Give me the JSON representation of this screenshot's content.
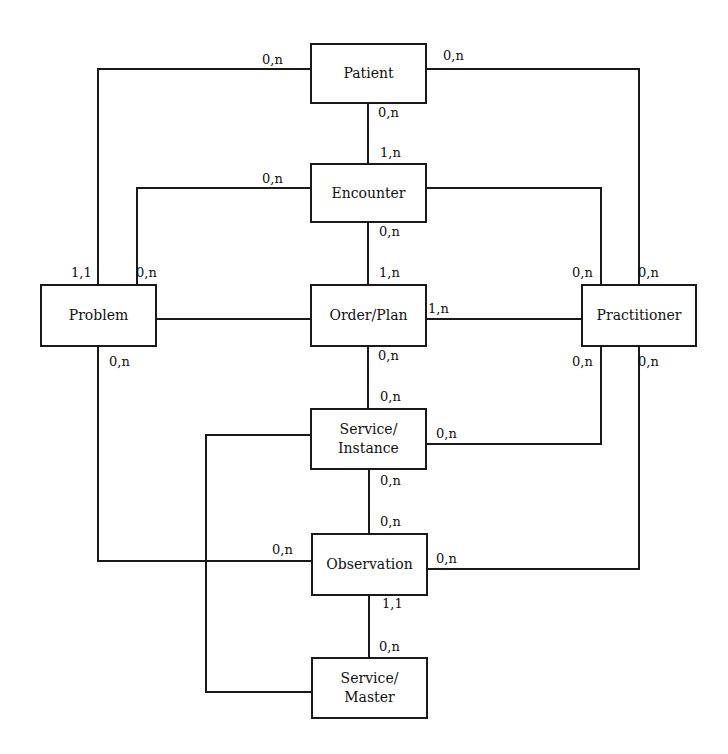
{
  "diagram": {
    "type": "entity-relationship",
    "colors": {
      "line": "#1a1a1a",
      "background": "#ffffff",
      "text": "#111111"
    },
    "entities": [
      {
        "id": "patient",
        "label": "Patient"
      },
      {
        "id": "encounter",
        "label": "Encounter"
      },
      {
        "id": "problem",
        "label": "Problem"
      },
      {
        "id": "order_plan",
        "label": "Order/Plan"
      },
      {
        "id": "practitioner",
        "label": "Practitioner"
      },
      {
        "id": "service_instance",
        "label": "Service/\nInstance"
      },
      {
        "id": "observation",
        "label": "Observation"
      },
      {
        "id": "service_master",
        "label": "Service/\nMaster"
      }
    ],
    "relationships": [
      {
        "from": "patient",
        "to": "encounter",
        "from_card": "0,n",
        "to_card": "1,n"
      },
      {
        "from": "patient",
        "to": "problem",
        "from_card": "0,n",
        "to_card": "1,1"
      },
      {
        "from": "patient",
        "to": "practitioner",
        "from_card": "0,n",
        "to_card": "0,n"
      },
      {
        "from": "encounter",
        "to": "problem",
        "from_card": "0,n",
        "to_card": "0,n"
      },
      {
        "from": "encounter",
        "to": "order_plan",
        "from_card": "0,n",
        "to_card": "1,n"
      },
      {
        "from": "encounter",
        "to": "practitioner",
        "from_card": "",
        "to_card": "0,n"
      },
      {
        "from": "problem",
        "to": "order_plan",
        "from_card": "",
        "to_card": ""
      },
      {
        "from": "order_plan",
        "to": "practitioner",
        "from_card": "1,n",
        "to_card": ""
      },
      {
        "from": "order_plan",
        "to": "service_instance",
        "from_card": "0,n",
        "to_card": "0,n"
      },
      {
        "from": "service_instance",
        "to": "practitioner",
        "from_card": "0,n",
        "to_card": "0,n"
      },
      {
        "from": "service_instance",
        "to": "observation",
        "from_card": "0,n",
        "to_card": "0,n"
      },
      {
        "from": "service_instance",
        "to": "service_master",
        "from_card": "",
        "to_card": ""
      },
      {
        "from": "problem",
        "to": "observation",
        "from_card": "0,n",
        "to_card": "0,n"
      },
      {
        "from": "observation",
        "to": "practitioner",
        "from_card": "0,n",
        "to_card": "0,n"
      },
      {
        "from": "observation",
        "to": "service_master",
        "from_card": "1,1",
        "to_card": "0,n"
      }
    ],
    "cardinality_labels": {
      "patient_left": "0,n",
      "patient_right": "0,n",
      "patient_bottom": "0,n",
      "encounter_top": "1,n",
      "encounter_left": "0,n",
      "encounter_bottom": "0,n",
      "problem_top_left": "1,1",
      "problem_top_right": "0,n",
      "problem_bottom": "0,n",
      "order_top": "1,n",
      "order_right": "1,n",
      "order_bottom": "0,n",
      "practitioner_top_left": "0,n",
      "practitioner_top_right": "0,n",
      "practitioner_bottom_left": "0,n",
      "practitioner_bottom_right": "0,n",
      "service_instance_top": "0,n",
      "service_instance_right": "0,n",
      "service_instance_bottom": "0,n",
      "observation_top": "0,n",
      "observation_left": "0,n",
      "observation_right": "0,n",
      "observation_bottom": "1,1",
      "service_master_top": "0,n"
    }
  }
}
